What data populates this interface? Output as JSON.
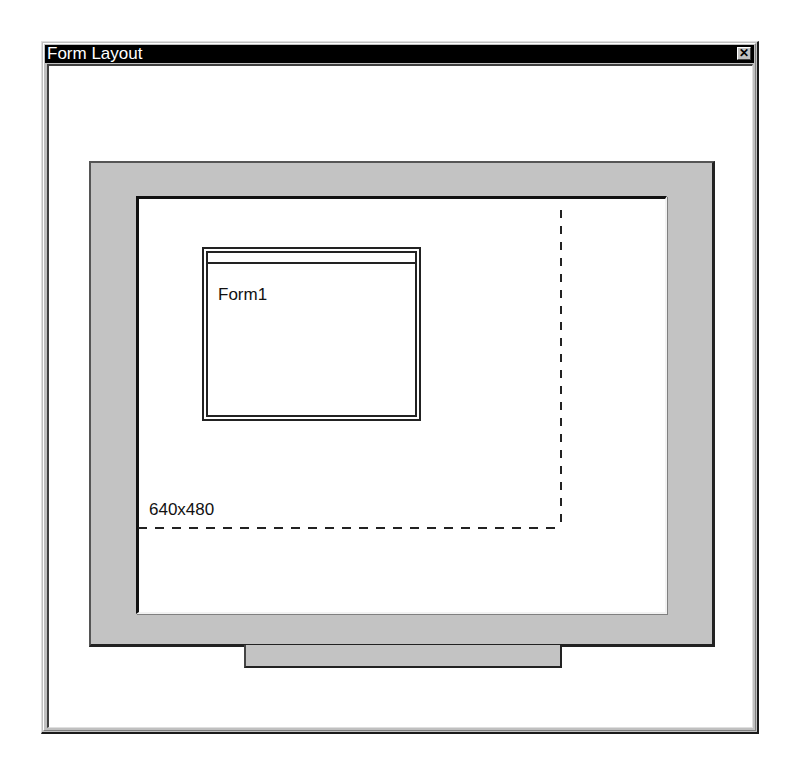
{
  "window": {
    "title": "Form Layout",
    "close_icon": "close-icon",
    "close_glyph": "✕"
  },
  "preview": {
    "resolution_guide_label": "640x480",
    "forms": [
      {
        "label": "Form1"
      }
    ]
  },
  "colors": {
    "titlebar": "#000000",
    "monitor_bezel": "#c3c3c3",
    "screen": "#ffffff"
  }
}
